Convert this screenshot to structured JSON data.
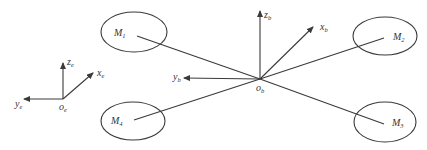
{
  "diagram": {
    "type": "quadrotor-frame-diagram",
    "stroke_color": "#3a3a3a",
    "earth_frame": {
      "origin": {
        "main": "o",
        "sub": "e"
      },
      "axes": [
        {
          "id": "z",
          "main": "z",
          "sub": "e"
        },
        {
          "id": "x",
          "main": "x",
          "sub": "e"
        },
        {
          "id": "y",
          "main": "y",
          "sub": "e"
        }
      ]
    },
    "body_frame": {
      "origin": {
        "main": "o",
        "sub": "b"
      },
      "axes": [
        {
          "id": "z",
          "main": "z",
          "sub": "b"
        },
        {
          "id": "x",
          "main": "x",
          "sub": "b"
        },
        {
          "id": "y",
          "main": "y",
          "sub": "b"
        }
      ]
    },
    "motors": [
      {
        "id": "M1",
        "main": "M",
        "sub": "1"
      },
      {
        "id": "M2",
        "main": "M",
        "sub": "2"
      },
      {
        "id": "M3",
        "main": "M",
        "sub": "3"
      },
      {
        "id": "M4",
        "main": "M",
        "sub": "4"
      }
    ]
  }
}
